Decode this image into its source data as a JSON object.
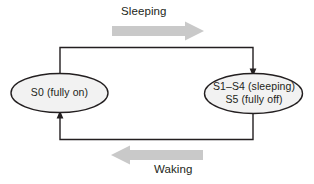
{
  "diagram": {
    "type": "state-transition-cycle",
    "nodes": [
      {
        "id": "s0",
        "lines": [
          "S0 (fully on)"
        ],
        "shape": "ellipse",
        "fill": "#f2f2f2",
        "stroke": "#231f20"
      },
      {
        "id": "s1_s5",
        "lines": [
          "S1–S4 (sleeping)",
          "S5 (fully off)"
        ],
        "shape": "ellipse",
        "fill": "#f2f2f2",
        "stroke": "#231f20"
      }
    ],
    "transitions": [
      {
        "id": "sleeping",
        "label": "Sleeping",
        "from": "s0",
        "to": "s1_s5",
        "direction": "right",
        "arrow_color": "#c9c9c9"
      },
      {
        "id": "waking",
        "label": "Waking",
        "from": "s1_s5",
        "to": "s0",
        "direction": "left",
        "arrow_color": "#c9c9c9"
      }
    ],
    "node_s0_line1": "S0 (fully on)",
    "node_sleep_line1": "S1–S4 (sleeping)",
    "node_sleep_line2": "S5 (fully off)",
    "label_sleeping": "Sleeping",
    "label_waking": "Waking",
    "colors": {
      "line": "#231f20",
      "ellipse_fill": "#f2f2f2",
      "block_arrow": "#c9c9c9",
      "background": "#ffffff",
      "text": "#231f20"
    }
  }
}
